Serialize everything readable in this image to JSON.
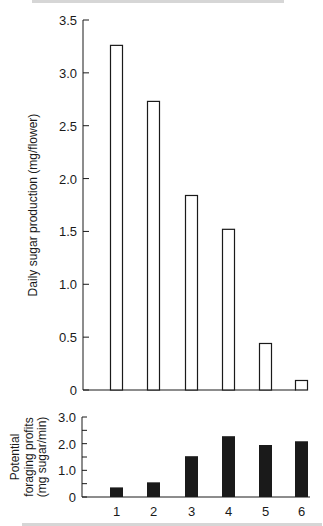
{
  "chart_data": [
    {
      "type": "bar",
      "title": "",
      "xlabel": "",
      "ylabel": "Daily sugar production (mg/flower)",
      "categories": [
        "1",
        "2",
        "3",
        "4",
        "5",
        "6"
      ],
      "values": [
        3.26,
        2.73,
        1.84,
        1.52,
        0.44,
        0.09
      ],
      "ylim": [
        0,
        3.5
      ],
      "yticks": [
        "0",
        "0.5",
        "1.0",
        "1.5",
        "2.0",
        "2.5",
        "3.0",
        "3.5"
      ],
      "bar_style": "outline",
      "grid": false
    },
    {
      "type": "bar",
      "title": "",
      "xlabel": "",
      "ylabel": "Potential foraging profits (mg sugar/min)",
      "ylabel_lines": [
        "Potential",
        "foraging profits",
        "(mg sugar/min)"
      ],
      "categories": [
        "1",
        "2",
        "3",
        "4",
        "5",
        "6"
      ],
      "values": [
        0.36,
        0.55,
        1.53,
        2.28,
        1.95,
        2.09
      ],
      "ylim": [
        0,
        3.0
      ],
      "yticks": [
        "0",
        "1.0",
        "2.0",
        "3.0"
      ],
      "bar_style": "filled",
      "grid": false
    }
  ],
  "colors": {
    "ink": "#1a1a1a",
    "background": "#ffffff"
  }
}
